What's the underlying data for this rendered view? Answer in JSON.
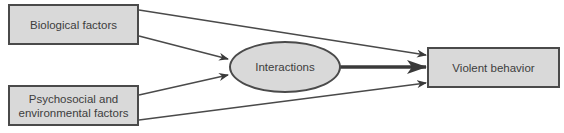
{
  "diagram": {
    "nodes": {
      "biological": {
        "label": "Biological factors"
      },
      "psychosocial": {
        "label": "Psychosocial and environmental factors"
      },
      "interactions": {
        "label": "Interactions"
      },
      "violent": {
        "label": "Violent behavior"
      }
    },
    "edges": [
      {
        "from": "Biological factors",
        "to": "Violent behavior"
      },
      {
        "from": "Biological factors",
        "to": "Interactions"
      },
      {
        "from": "Psychosocial and environmental factors",
        "to": "Interactions"
      },
      {
        "from": "Psychosocial and environmental factors",
        "to": "Violent behavior"
      },
      {
        "from": "Interactions",
        "to": "Violent behavior",
        "emphasis": "bold"
      }
    ],
    "colors": {
      "fill": "#d9d9d9",
      "stroke": "#4a4a4a",
      "text": "#3d3d3d"
    }
  }
}
